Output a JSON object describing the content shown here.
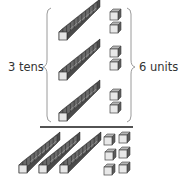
{
  "diagram": {
    "type": "base-ten-blocks",
    "labels": {
      "tens": "3 tens",
      "units": "6 units"
    },
    "groups": [
      {
        "rods": 1,
        "units": 2
      },
      {
        "rods": 1,
        "units": 2
      },
      {
        "rods": 1,
        "units": 2
      }
    ],
    "total": {
      "rods": 3,
      "units": 6
    },
    "colors": {
      "cube_top": "#a8a8a8",
      "cube_side": "#4d4d4d",
      "cube_front": "#e6e6e6",
      "rod_body": "#5a5a5a",
      "line": "#1a1a1a",
      "brace": "#9a9a9a"
    }
  }
}
